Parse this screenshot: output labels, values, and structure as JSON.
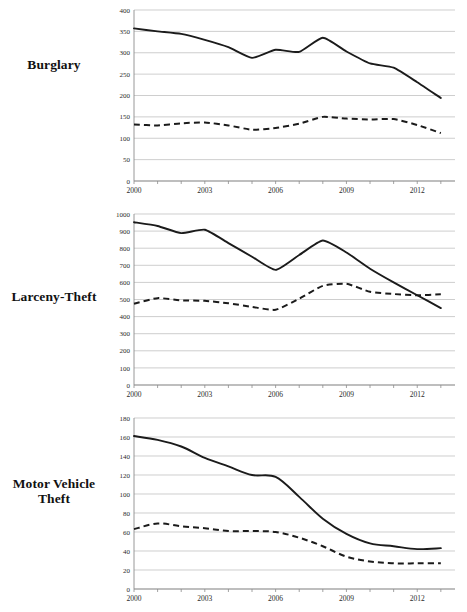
{
  "figure": {
    "panels": [
      {
        "label": "Burglary",
        "label_lines": [
          "Burglary"
        ]
      },
      {
        "label": "Larceny-Theft",
        "label_lines": [
          "Larceny-Theft"
        ]
      },
      {
        "label": "Motor Vehicle Theft",
        "label_lines": [
          "Motor Vehicle",
          "Theft"
        ]
      }
    ]
  },
  "chart_data": [
    {
      "type": "line",
      "title": "Burglary",
      "xlabel": "",
      "ylabel": "",
      "grid": true,
      "legend": "none",
      "xlim": [
        2000,
        2013.6
      ],
      "ylim": [
        0,
        400
      ],
      "yticks": [
        0,
        50,
        100,
        150,
        200,
        250,
        300,
        350,
        400
      ],
      "ytick_labels": [
        "0",
        "50",
        "100",
        "150",
        "200",
        "250",
        "300",
        "350",
        "400"
      ],
      "xticks": [
        2000,
        2001,
        2002,
        2003,
        2004,
        2005,
        2006,
        2007,
        2008,
        2009,
        2010,
        2011,
        2012,
        2013
      ],
      "xtick_labels": [
        "2000",
        "",
        "",
        "2003",
        "",
        "",
        "2006",
        "",
        "",
        "2009",
        "",
        "",
        "2012",
        ""
      ],
      "x": [
        2000,
        2001,
        2002,
        2003,
        2004,
        2005,
        2006,
        2007,
        2008,
        2009,
        2010,
        2011,
        2012,
        2013
      ],
      "series": [
        {
          "name": "solid-series",
          "style": "solid",
          "values": [
            357,
            350,
            344,
            330,
            313,
            288,
            307,
            302,
            335,
            303,
            275,
            265,
            231,
            194
          ]
        },
        {
          "name": "dashed-series",
          "style": "dashed",
          "values": [
            132,
            130,
            135,
            137,
            130,
            120,
            124,
            134,
            150,
            146,
            144,
            145,
            131,
            112
          ]
        }
      ]
    },
    {
      "type": "line",
      "title": "Larceny-Theft",
      "xlabel": "",
      "ylabel": "",
      "grid": true,
      "legend": "none",
      "xlim": [
        2000,
        2013.6
      ],
      "ylim": [
        0,
        1000
      ],
      "yticks": [
        0,
        100,
        200,
        300,
        400,
        500,
        600,
        700,
        800,
        900,
        1000
      ],
      "ytick_labels": [
        "0",
        "100",
        "200",
        "300",
        "400",
        "500",
        "600",
        "700",
        "800",
        "900",
        "1000"
      ],
      "xticks": [
        2000,
        2001,
        2002,
        2003,
        2004,
        2005,
        2006,
        2007,
        2008,
        2009,
        2010,
        2011,
        2012,
        2013
      ],
      "xtick_labels": [
        "2000",
        "",
        "",
        "2003",
        "",
        "",
        "2006",
        "",
        "",
        "2009",
        "",
        "",
        "2012",
        ""
      ],
      "x": [
        2000,
        2001,
        2002,
        2003,
        2004,
        2005,
        2006,
        2007,
        2008,
        2009,
        2010,
        2011,
        2012,
        2013
      ],
      "series": [
        {
          "name": "solid-series",
          "style": "solid",
          "values": [
            952,
            930,
            888,
            908,
            830,
            750,
            673,
            760,
            845,
            775,
            680,
            600,
            525,
            450
          ]
        },
        {
          "name": "dashed-series",
          "style": "dashed",
          "values": [
            475,
            508,
            495,
            492,
            478,
            457,
            440,
            505,
            580,
            592,
            545,
            532,
            525,
            530
          ]
        }
      ]
    },
    {
      "type": "line",
      "title": "Motor Vehicle Theft",
      "xlabel": "",
      "ylabel": "",
      "grid": true,
      "legend": "none",
      "xlim": [
        2000,
        2013.6
      ],
      "ylim": [
        0,
        180
      ],
      "yticks": [
        0,
        20,
        40,
        60,
        80,
        100,
        120,
        140,
        160,
        180
      ],
      "ytick_labels": [
        "0",
        "20",
        "40",
        "60",
        "80",
        "100",
        "120",
        "140",
        "160",
        "180"
      ],
      "xticks": [
        2000,
        2001,
        2002,
        2003,
        2004,
        2005,
        2006,
        2007,
        2008,
        2009,
        2010,
        2011,
        2012,
        2013
      ],
      "xtick_labels": [
        "2000",
        "",
        "",
        "2003",
        "",
        "",
        "2006",
        "",
        "",
        "2009",
        "",
        "",
        "2012",
        ""
      ],
      "x": [
        2000,
        2001,
        2002,
        2003,
        2004,
        2005,
        2006,
        2007,
        2008,
        2009,
        2010,
        2011,
        2012,
        2013
      ],
      "series": [
        {
          "name": "solid-series",
          "style": "solid",
          "values": [
            161,
            157,
            150,
            138,
            129,
            120,
            118,
            97,
            74,
            58,
            48,
            45,
            42,
            43
          ]
        },
        {
          "name": "dashed-series",
          "style": "dashed",
          "values": [
            63,
            69,
            66,
            64,
            61,
            61,
            60,
            54,
            45,
            34,
            29,
            27,
            27,
            27
          ]
        }
      ]
    }
  ]
}
